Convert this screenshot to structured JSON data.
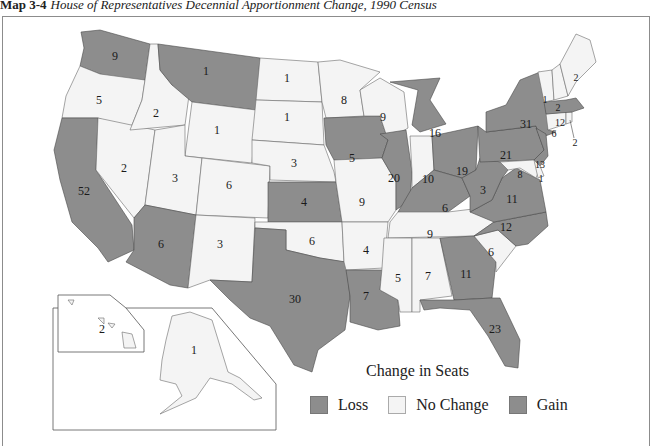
{
  "title": {
    "label": "Map 3-4",
    "caption": "House of Representatives Decennial Apportionment Change, 1990 Census"
  },
  "legend": {
    "title": "Change in Seats",
    "items": [
      {
        "label": "Loss",
        "color": "#8d8d8d"
      },
      {
        "label": "No Change",
        "color": "#f4f4f4"
      },
      {
        "label": "Gain",
        "color": "#8d8d8d"
      }
    ]
  },
  "states": {
    "WA": {
      "seats": "9",
      "category": "gray"
    },
    "OR": {
      "seats": "5",
      "category": "no-change"
    },
    "CA": {
      "seats": "52",
      "category": "gray"
    },
    "ID": {
      "seats": "2",
      "category": "no-change"
    },
    "NV": {
      "seats": "2",
      "category": "no-change"
    },
    "MT": {
      "seats": "1",
      "category": "gray"
    },
    "WY": {
      "seats": "1",
      "category": "no-change"
    },
    "UT": {
      "seats": "3",
      "category": "no-change"
    },
    "AZ": {
      "seats": "6",
      "category": "gray"
    },
    "CO": {
      "seats": "6",
      "category": "no-change"
    },
    "NM": {
      "seats": "3",
      "category": "no-change"
    },
    "ND": {
      "seats": "1",
      "category": "no-change"
    },
    "SD": {
      "seats": "1",
      "category": "no-change"
    },
    "NE": {
      "seats": "3",
      "category": "no-change"
    },
    "KS": {
      "seats": "4",
      "category": "gray"
    },
    "OK": {
      "seats": "6",
      "category": "no-change"
    },
    "TX": {
      "seats": "30",
      "category": "gray"
    },
    "MN": {
      "seats": "8",
      "category": "no-change"
    },
    "IA": {
      "seats": "5",
      "category": "gray"
    },
    "MO": {
      "seats": "9",
      "category": "no-change"
    },
    "AR": {
      "seats": "4",
      "category": "no-change"
    },
    "LA": {
      "seats": "7",
      "category": "gray"
    },
    "WI": {
      "seats": "9",
      "category": "no-change"
    },
    "IL": {
      "seats": "20",
      "category": "gray"
    },
    "MI": {
      "seats": "16",
      "category": "gray"
    },
    "IN": {
      "seats": "10",
      "category": "no-change"
    },
    "OH": {
      "seats": "19",
      "category": "gray"
    },
    "KY": {
      "seats": "6",
      "category": "gray"
    },
    "TN": {
      "seats": "9",
      "category": "no-change"
    },
    "MS": {
      "seats": "5",
      "category": "no-change"
    },
    "AL": {
      "seats": "7",
      "category": "no-change"
    },
    "GA": {
      "seats": "11",
      "category": "gray"
    },
    "FL": {
      "seats": "23",
      "category": "gray"
    },
    "SC": {
      "seats": "6",
      "category": "no-change"
    },
    "NC": {
      "seats": "12",
      "category": "gray"
    },
    "VA": {
      "seats": "11",
      "category": "gray"
    },
    "WV": {
      "seats": "3",
      "category": "gray"
    },
    "PA": {
      "seats": "21",
      "category": "gray"
    },
    "NY": {
      "seats": "31",
      "category": "gray"
    },
    "NJ": {
      "seats": "13",
      "category": "gray"
    },
    "DE": {
      "seats": "1",
      "category": "no-change"
    },
    "MD": {
      "seats": "8",
      "category": "no-change"
    },
    "CT": {
      "seats": "6",
      "category": "no-change"
    },
    "RI": {
      "seats": "2",
      "category": "no-change"
    },
    "MA": {
      "seats": "12",
      "category": "gray"
    },
    "VT": {
      "seats": "1",
      "category": "no-change"
    },
    "NH": {
      "seats": "2",
      "category": "no-change"
    },
    "ME": {
      "seats": "2",
      "category": "no-change"
    },
    "AK": {
      "seats": "1",
      "category": "no-change"
    },
    "HI": {
      "seats": "2",
      "category": "no-change"
    }
  }
}
